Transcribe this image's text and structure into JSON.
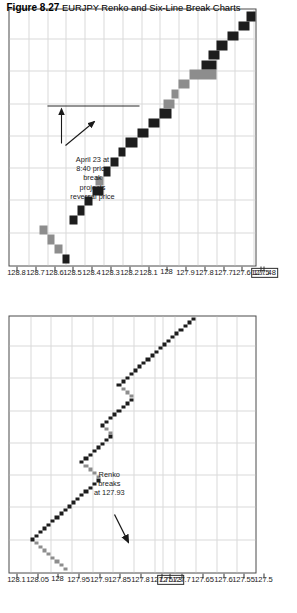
{
  "caption": {
    "label": "Figure 8.27",
    "text": "EURJPY Renko and Six-Line Break Charts"
  },
  "colors": {
    "up_brick": "#1d1d1d",
    "down_brick": "#8d8d8d",
    "grid": "#d9d9d9",
    "frame": "#4a4a4a",
    "text": "#1a1a1a"
  },
  "charts": [
    {
      "name": "renko-chart",
      "title": "EURJPY Renko",
      "annotation": "Renko\nbreaks\nat 127.93",
      "annotation_value": "127.93",
      "highlight_tick": "127.73",
      "axis_labels": [
        "128.1",
        "128.05",
        "128",
        "127.95",
        "127.9",
        "127.85",
        "127.8",
        "127.75",
        "127.73",
        "127.7",
        "127.65",
        "127.6",
        "127.55",
        "127.5"
      ]
    },
    {
      "name": "six-line-break-chart",
      "title": "EURJPY Six-Line Break",
      "annotation": "April 23 at\n8:40 price\nbreak\nprojects\nreversal price",
      "highlight_tick": "127.48",
      "axis_labels": [
        "128.8",
        "128.7",
        "128.6",
        "128.5",
        "128.4",
        "128.3",
        "128.2",
        "128.1",
        "128",
        "127.9",
        "127.8",
        "127.7",
        "127.6",
        "127.5",
        "127.48"
      ]
    }
  ],
  "chart_data": [
    {
      "type": "line",
      "name": "renko-chart",
      "title": "EURJPY Renko",
      "xlabel": "",
      "ylabel": "Price",
      "ylim": [
        127.5,
        128.1
      ],
      "grid": true,
      "legend": "none",
      "brick_size": 0.01,
      "annotations": [
        {
          "text": "Renko breaks at 127.93",
          "value": 127.93
        }
      ],
      "axis_ticks": [
        128.1,
        128.05,
        128,
        127.95,
        127.9,
        127.85,
        127.8,
        127.75,
        127.73,
        127.7,
        127.65,
        127.6,
        127.55,
        127.5
      ],
      "highlighted_tick": 127.73,
      "bricks": [
        {
          "i": 1,
          "open": 127.96,
          "close": 127.97,
          "dir": "down"
        },
        {
          "i": 2,
          "open": 127.97,
          "close": 127.98,
          "dir": "down"
        },
        {
          "i": 3,
          "open": 127.98,
          "close": 127.99,
          "dir": "down"
        },
        {
          "i": 4,
          "open": 127.99,
          "close": 128.0,
          "dir": "down"
        },
        {
          "i": 5,
          "open": 128.0,
          "close": 128.01,
          "dir": "down"
        },
        {
          "i": 6,
          "open": 128.01,
          "close": 128.02,
          "dir": "down"
        },
        {
          "i": 7,
          "open": 128.02,
          "close": 128.03,
          "dir": "down"
        },
        {
          "i": 8,
          "open": 128.03,
          "close": 128.04,
          "dir": "down"
        },
        {
          "i": 9,
          "open": 128.05,
          "close": 128.04,
          "dir": "up"
        },
        {
          "i": 10,
          "open": 128.04,
          "close": 128.03,
          "dir": "up"
        },
        {
          "i": 11,
          "open": 128.03,
          "close": 128.02,
          "dir": "up"
        },
        {
          "i": 12,
          "open": 128.02,
          "close": 128.01,
          "dir": "up"
        },
        {
          "i": 13,
          "open": 128.01,
          "close": 128.0,
          "dir": "up"
        },
        {
          "i": 14,
          "open": 128.0,
          "close": 127.99,
          "dir": "up"
        },
        {
          "i": 15,
          "open": 127.99,
          "close": 127.98,
          "dir": "up"
        },
        {
          "i": 16,
          "open": 127.98,
          "close": 127.97,
          "dir": "up"
        },
        {
          "i": 17,
          "open": 127.97,
          "close": 127.96,
          "dir": "up"
        },
        {
          "i": 18,
          "open": 127.96,
          "close": 127.95,
          "dir": "up"
        },
        {
          "i": 19,
          "open": 127.95,
          "close": 127.94,
          "dir": "up"
        },
        {
          "i": 20,
          "open": 127.94,
          "close": 127.93,
          "dir": "up"
        },
        {
          "i": 21,
          "open": 127.93,
          "close": 127.92,
          "dir": "up"
        },
        {
          "i": 22,
          "open": 127.92,
          "close": 127.91,
          "dir": "up"
        },
        {
          "i": 23,
          "open": 127.91,
          "close": 127.9,
          "dir": "up"
        },
        {
          "i": 24,
          "open": 127.9,
          "close": 127.89,
          "dir": "up"
        },
        {
          "i": 25,
          "open": 127.89,
          "close": 127.88,
          "dir": "up"
        },
        {
          "i": 26,
          "open": 127.88,
          "close": 127.89,
          "dir": "down"
        },
        {
          "i": 27,
          "open": 127.89,
          "close": 127.9,
          "dir": "down"
        },
        {
          "i": 28,
          "open": 127.9,
          "close": 127.91,
          "dir": "down"
        },
        {
          "i": 29,
          "open": 127.91,
          "close": 127.92,
          "dir": "down"
        },
        {
          "i": 30,
          "open": 127.93,
          "close": 127.92,
          "dir": "up"
        },
        {
          "i": 31,
          "open": 127.92,
          "close": 127.91,
          "dir": "up"
        },
        {
          "i": 32,
          "open": 127.91,
          "close": 127.9,
          "dir": "up"
        },
        {
          "i": 33,
          "open": 127.9,
          "close": 127.89,
          "dir": "up"
        },
        {
          "i": 34,
          "open": 127.89,
          "close": 127.88,
          "dir": "up"
        },
        {
          "i": 35,
          "open": 127.88,
          "close": 127.87,
          "dir": "up"
        },
        {
          "i": 36,
          "open": 127.87,
          "close": 127.86,
          "dir": "up"
        },
        {
          "i": 37,
          "open": 127.86,
          "close": 127.85,
          "dir": "up"
        },
        {
          "i": 38,
          "open": 127.85,
          "close": 127.86,
          "dir": "down"
        },
        {
          "i": 39,
          "open": 127.86,
          "close": 127.87,
          "dir": "down"
        },
        {
          "i": 40,
          "open": 127.88,
          "close": 127.87,
          "dir": "up"
        },
        {
          "i": 41,
          "open": 127.87,
          "close": 127.86,
          "dir": "up"
        },
        {
          "i": 42,
          "open": 127.86,
          "close": 127.85,
          "dir": "up"
        },
        {
          "i": 43,
          "open": 127.85,
          "close": 127.84,
          "dir": "up"
        },
        {
          "i": 44,
          "open": 127.84,
          "close": 127.83,
          "dir": "up"
        },
        {
          "i": 45,
          "open": 127.83,
          "close": 127.82,
          "dir": "up"
        },
        {
          "i": 46,
          "open": 127.82,
          "close": 127.81,
          "dir": "up"
        },
        {
          "i": 47,
          "open": 127.81,
          "close": 127.8,
          "dir": "up"
        },
        {
          "i": 48,
          "open": 127.8,
          "close": 127.81,
          "dir": "down"
        },
        {
          "i": 49,
          "open": 127.81,
          "close": 127.82,
          "dir": "down"
        },
        {
          "i": 50,
          "open": 127.82,
          "close": 127.83,
          "dir": "down"
        },
        {
          "i": 51,
          "open": 127.84,
          "close": 127.83,
          "dir": "up"
        },
        {
          "i": 52,
          "open": 127.83,
          "close": 127.82,
          "dir": "up"
        },
        {
          "i": 53,
          "open": 127.82,
          "close": 127.81,
          "dir": "up"
        },
        {
          "i": 54,
          "open": 127.81,
          "close": 127.8,
          "dir": "up"
        },
        {
          "i": 55,
          "open": 127.8,
          "close": 127.79,
          "dir": "up"
        },
        {
          "i": 56,
          "open": 127.79,
          "close": 127.78,
          "dir": "up"
        },
        {
          "i": 57,
          "open": 127.78,
          "close": 127.77,
          "dir": "up"
        },
        {
          "i": 58,
          "open": 127.77,
          "close": 127.76,
          "dir": "up"
        },
        {
          "i": 59,
          "open": 127.76,
          "close": 127.75,
          "dir": "up"
        },
        {
          "i": 60,
          "open": 127.75,
          "close": 127.74,
          "dir": "up"
        },
        {
          "i": 61,
          "open": 127.74,
          "close": 127.73,
          "dir": "up"
        },
        {
          "i": 62,
          "open": 127.73,
          "close": 127.72,
          "dir": "up"
        },
        {
          "i": 63,
          "open": 127.72,
          "close": 127.71,
          "dir": "up"
        },
        {
          "i": 64,
          "open": 127.71,
          "close": 127.7,
          "dir": "up"
        },
        {
          "i": 65,
          "open": 127.7,
          "close": 127.69,
          "dir": "up"
        },
        {
          "i": 66,
          "open": 127.69,
          "close": 127.68,
          "dir": "up"
        },
        {
          "i": 67,
          "open": 127.68,
          "close": 127.67,
          "dir": "up"
        },
        {
          "i": 68,
          "open": 127.67,
          "close": 127.66,
          "dir": "up"
        },
        {
          "i": 69,
          "open": 127.66,
          "close": 127.65,
          "dir": "up"
        }
      ]
    },
    {
      "type": "line",
      "name": "six-line-break-chart",
      "title": "EURJPY Six-Line Break",
      "xlabel": "",
      "ylabel": "Price",
      "ylim": [
        127.48,
        128.8
      ],
      "grid": true,
      "legend": "none",
      "annotations": [
        {
          "text": "April 23 at 8:40 price break projects reversal price"
        }
      ],
      "axis_ticks": [
        128.8,
        128.7,
        128.6,
        128.5,
        128.4,
        128.3,
        128.2,
        128.1,
        128.0,
        127.9,
        127.8,
        127.7,
        127.6,
        127.5,
        127.48
      ],
      "highlighted_tick": 127.48,
      "reversal_price": 127.9,
      "blocks": [
        {
          "i": 1,
          "top": 128.52,
          "bottom": 128.48,
          "dir": "up"
        },
        {
          "i": 2,
          "top": 128.56,
          "bottom": 128.52,
          "dir": "down"
        },
        {
          "i": 3,
          "top": 128.6,
          "bottom": 128.56,
          "dir": "down"
        },
        {
          "i": 4,
          "top": 128.64,
          "bottom": 128.6,
          "dir": "down"
        },
        {
          "i": 5,
          "top": 128.48,
          "bottom": 128.44,
          "dir": "up"
        },
        {
          "i": 6,
          "top": 128.44,
          "bottom": 128.4,
          "dir": "up"
        },
        {
          "i": 7,
          "top": 128.4,
          "bottom": 128.36,
          "dir": "up"
        },
        {
          "i": 8,
          "top": 128.36,
          "bottom": 128.3,
          "dir": "up"
        },
        {
          "i": 9,
          "top": 128.34,
          "bottom": 128.3,
          "dir": "down"
        },
        {
          "i": 10,
          "top": 128.3,
          "bottom": 128.26,
          "dir": "up"
        },
        {
          "i": 11,
          "top": 128.26,
          "bottom": 128.22,
          "dir": "up"
        },
        {
          "i": 12,
          "top": 128.22,
          "bottom": 128.18,
          "dir": "up"
        },
        {
          "i": 13,
          "top": 128.18,
          "bottom": 128.12,
          "dir": "up"
        },
        {
          "i": 14,
          "top": 128.12,
          "bottom": 128.06,
          "dir": "up"
        },
        {
          "i": 15,
          "top": 128.06,
          "bottom": 128.0,
          "dir": "up"
        },
        {
          "i": 16,
          "top": 128.0,
          "bottom": 127.94,
          "dir": "up"
        },
        {
          "i": 17,
          "top": 127.98,
          "bottom": 127.92,
          "dir": "down"
        },
        {
          "i": 18,
          "top": 127.94,
          "bottom": 127.9,
          "dir": "down"
        },
        {
          "i": 19,
          "top": 127.9,
          "bottom": 127.84,
          "dir": "down"
        },
        {
          "i": 20,
          "top": 127.84,
          "bottom": 127.7,
          "dir": "down"
        },
        {
          "i": 21,
          "top": 127.78,
          "bottom": 127.7,
          "dir": "up"
        },
        {
          "i": 22,
          "top": 127.74,
          "bottom": 127.68,
          "dir": "up"
        },
        {
          "i": 23,
          "top": 127.7,
          "bottom": 127.64,
          "dir": "up"
        },
        {
          "i": 24,
          "top": 127.64,
          "bottom": 127.58,
          "dir": "up"
        },
        {
          "i": 25,
          "top": 127.58,
          "bottom": 127.52,
          "dir": "up"
        },
        {
          "i": 26,
          "top": 127.54,
          "bottom": 127.48,
          "dir": "up"
        }
      ]
    }
  ]
}
